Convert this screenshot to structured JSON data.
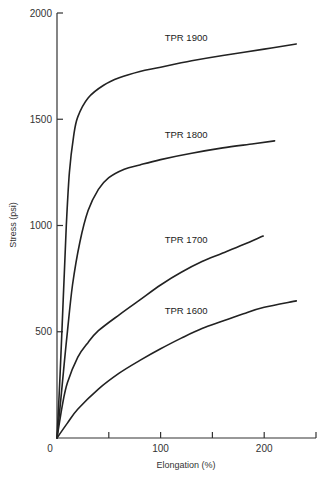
{
  "chart_data": {
    "type": "line",
    "title": "",
    "xlabel": "Elongation (%)",
    "ylabel": "Stress (psi)",
    "xlim": [
      0,
      250
    ],
    "ylim": [
      0,
      2000
    ],
    "x_ticks": [
      0,
      50,
      100,
      150,
      200,
      250
    ],
    "x_tick_labels": [
      "0",
      "",
      "100",
      "",
      "200",
      ""
    ],
    "y_ticks": [
      0,
      500,
      1000,
      1500,
      2000
    ],
    "y_tick_labels": [
      "",
      "500",
      "1000",
      "1500",
      "2000"
    ],
    "grid": false,
    "legend": "inline labels",
    "series": [
      {
        "name": "TPR 1900",
        "label_pos": [
          104,
          1870
        ],
        "points": [
          [
            0,
            0
          ],
          [
            3,
            300
          ],
          [
            6,
            650
          ],
          [
            9,
            1000
          ],
          [
            12,
            1250
          ],
          [
            16,
            1420
          ],
          [
            20,
            1510
          ],
          [
            30,
            1600
          ],
          [
            45,
            1660
          ],
          [
            60,
            1695
          ],
          [
            80,
            1725
          ],
          [
            100,
            1745
          ],
          [
            130,
            1775
          ],
          [
            160,
            1800
          ],
          [
            200,
            1830
          ],
          [
            231,
            1854
          ]
        ]
      },
      {
        "name": "TPR 1800",
        "label_pos": [
          104,
          1410
        ],
        "points": [
          [
            0,
            0
          ],
          [
            5,
            250
          ],
          [
            10,
            500
          ],
          [
            15,
            720
          ],
          [
            22,
            920
          ],
          [
            30,
            1070
          ],
          [
            40,
            1170
          ],
          [
            50,
            1225
          ],
          [
            65,
            1265
          ],
          [
            80,
            1285
          ],
          [
            100,
            1310
          ],
          [
            130,
            1340
          ],
          [
            160,
            1365
          ],
          [
            190,
            1385
          ],
          [
            210,
            1398
          ]
        ]
      },
      {
        "name": "TPR 1700",
        "label_pos": [
          104,
          920
        ],
        "points": [
          [
            0,
            0
          ],
          [
            5,
            150
          ],
          [
            10,
            260
          ],
          [
            20,
            380
          ],
          [
            30,
            450
          ],
          [
            40,
            505
          ],
          [
            60,
            580
          ],
          [
            80,
            650
          ],
          [
            100,
            720
          ],
          [
            120,
            780
          ],
          [
            140,
            830
          ],
          [
            160,
            870
          ],
          [
            180,
            910
          ],
          [
            199,
            950
          ]
        ]
      },
      {
        "name": "TPR 1600",
        "label_pos": [
          104,
          585
        ],
        "points": [
          [
            0,
            0
          ],
          [
            10,
            70
          ],
          [
            20,
            135
          ],
          [
            40,
            230
          ],
          [
            60,
            305
          ],
          [
            80,
            365
          ],
          [
            100,
            420
          ],
          [
            120,
            470
          ],
          [
            140,
            515
          ],
          [
            160,
            550
          ],
          [
            180,
            585
          ],
          [
            200,
            615
          ],
          [
            231,
            645
          ]
        ]
      }
    ]
  }
}
